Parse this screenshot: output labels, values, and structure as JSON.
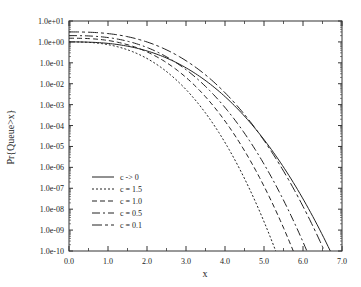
{
  "chart_data": {
    "type": "line",
    "title": "",
    "xlabel": "x",
    "ylabel": "Pr{Queue>x}",
    "xlim": [
      0.0,
      7.0
    ],
    "ylim": [
      1e-10,
      10
    ],
    "yscale": "log",
    "grid": false,
    "legend_position": "lower left",
    "x_ticks": [
      "0.0",
      "1.0",
      "2.0",
      "3.0",
      "4.0",
      "5.0",
      "6.0",
      "7.0"
    ],
    "y_ticks": [
      "1.0e+01",
      "1.0e+00",
      "1.0e-01",
      "1.0e-02",
      "1.0e-03",
      "1.0e-04",
      "1.0e-05",
      "1.0e-06",
      "1.0e-07",
      "1.0e-08",
      "1.0e-09",
      "1.0e-10"
    ],
    "series": [
      {
        "name": "c -> 0",
        "style": "solid",
        "start_y": 1.0,
        "x_at_1e-10": 6.7
      },
      {
        "name": "c = 1.5",
        "style": "dotted",
        "start_y": 1.0,
        "x_at_1e-10": 5.3
      },
      {
        "name": "c = 1.0",
        "style": "dashed",
        "start_y": 1.5,
        "x_at_1e-10": 5.75
      },
      {
        "name": "c = 0.5",
        "style": "long-dash",
        "start_y": 2.0,
        "x_at_1e-10": 6.1
      },
      {
        "name": "c = 0.1",
        "style": "dash-dot",
        "start_y": 3.0,
        "x_at_1e-10": 6.55
      }
    ]
  }
}
